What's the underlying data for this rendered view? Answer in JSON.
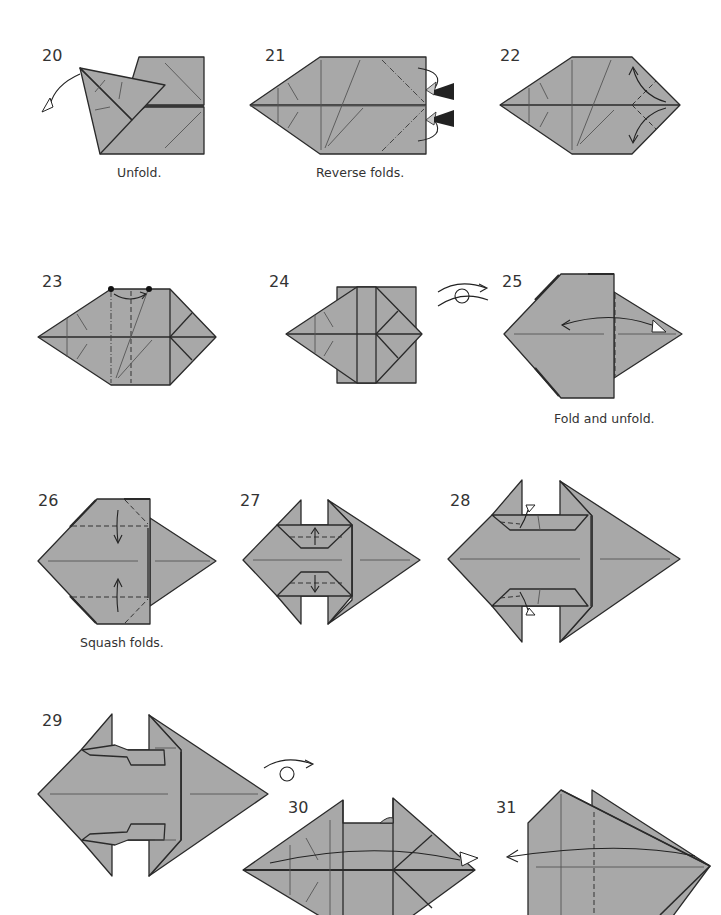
{
  "page": {
    "type": "origami-diagram-sequence",
    "paper_color": "#a8a8a8",
    "line_color": "#2a2a2a"
  },
  "steps": [
    {
      "number": "20",
      "caption": "Unfold.",
      "symbols": [
        "unfold-arrow-hollow"
      ]
    },
    {
      "number": "21",
      "caption": "Reverse folds.",
      "symbols": [
        "mountain-fold-lines",
        "reverse-fold-push-arrows"
      ]
    },
    {
      "number": "22",
      "caption": "",
      "symbols": [
        "curved-fold-arrows"
      ]
    },
    {
      "number": "23",
      "caption": "",
      "symbols": [
        "reference-dots",
        "mountain-fold-line",
        "valley-fold-line",
        "fold-arrow"
      ]
    },
    {
      "number": "24",
      "caption": "",
      "symbols": [
        "turn-over-symbol"
      ]
    },
    {
      "number": "25",
      "caption": "Fold and unfold.",
      "symbols": [
        "valley-fold-line",
        "fold-unfold-arrow"
      ]
    },
    {
      "number": "26",
      "caption": "Squash folds.",
      "symbols": [
        "valley-fold-lines",
        "squash-arrows"
      ]
    },
    {
      "number": "27",
      "caption": "",
      "symbols": [
        "valley-fold-lines",
        "fold-arrows"
      ]
    },
    {
      "number": "28",
      "caption": "",
      "symbols": [
        "hollow-arrows",
        "fold-lines"
      ]
    },
    {
      "number": "29",
      "caption": "",
      "symbols": [
        "turn-over-symbol"
      ]
    },
    {
      "number": "30",
      "caption": "",
      "symbols": [
        "fold-arrow-hollow"
      ]
    },
    {
      "number": "31",
      "caption": "",
      "symbols": [
        "valley-fold-line",
        "fold-arrow"
      ]
    }
  ]
}
